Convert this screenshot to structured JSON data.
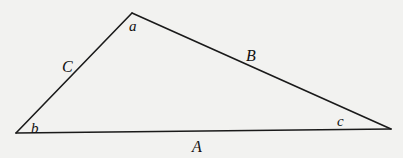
{
  "diagram": {
    "type": "triangle",
    "stroke_color": "#1a1a1a",
    "background": "#f2f2f0",
    "vertices": [
      {
        "id": "top",
        "angle_label": "a"
      },
      {
        "id": "bottom-left",
        "angle_label": "b"
      },
      {
        "id": "bottom-right",
        "angle_label": "c"
      }
    ],
    "sides": [
      {
        "label": "A",
        "between": [
          "bottom-left",
          "bottom-right"
        ],
        "opposite": "top"
      },
      {
        "label": "B",
        "between": [
          "top",
          "bottom-right"
        ],
        "opposite": "bottom-left"
      },
      {
        "label": "C",
        "between": [
          "top",
          "bottom-left"
        ],
        "opposite": "bottom-right"
      }
    ]
  }
}
